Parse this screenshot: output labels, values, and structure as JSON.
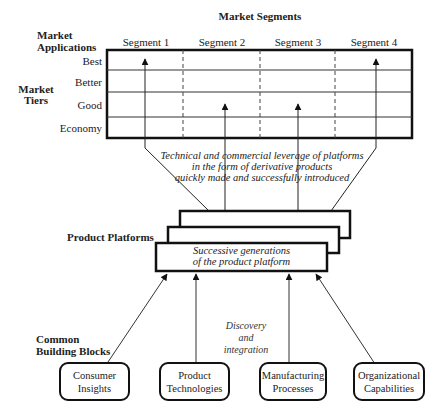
{
  "header": {
    "market_segments": "Market Segments",
    "market_applications": "Market Applications",
    "market_tiers": "Market Tiers"
  },
  "segments": [
    "Segment 1",
    "Segment 2",
    "Segment 3",
    "Segment 4"
  ],
  "tiers": [
    "Best",
    "Better",
    "Good",
    "Economy"
  ],
  "derivative_arrows": [
    {
      "segment": "Segment 1",
      "reaches_tier": "Best"
    },
    {
      "segment": "Segment 2",
      "reaches_tier": "Good"
    },
    {
      "segment": "Segment 3",
      "reaches_tier": "Good"
    },
    {
      "segment": "Segment 4",
      "reaches_tier": "Best"
    }
  ],
  "leverage_text": {
    "line1": "Technical and commercial leverage of platforms",
    "line2": "in the form of derivative products",
    "line3": "quickly made and successfully introduced"
  },
  "platforms": {
    "label": "Product Platforms",
    "text_line1": "Successive generations",
    "text_line2": "of the product platform"
  },
  "building_blocks": {
    "label_line1": "Common",
    "label_line2": "Building Blocks",
    "discovery_line1": "Discovery",
    "discovery_line2": "and",
    "discovery_line3": "integration",
    "items": [
      {
        "line1": "Consumer",
        "line2": "Insights"
      },
      {
        "line1": "Product",
        "line2": "Technologies"
      },
      {
        "line1": "Manufacturing",
        "line2": "Processes"
      },
      {
        "line1": "Organizational",
        "line2": "Capabilities"
      }
    ]
  }
}
